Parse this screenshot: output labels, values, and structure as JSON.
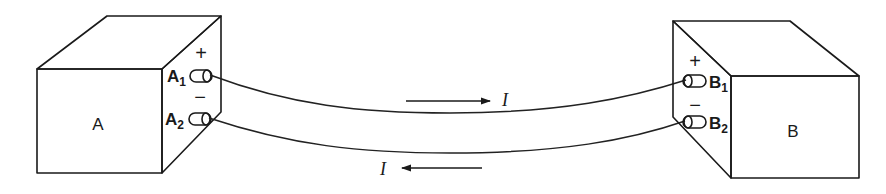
{
  "diagram": {
    "type": "two-box current circuit",
    "colors": {
      "ink": "#1a1a1a",
      "background": "#ffffff",
      "stipple": "#3a3a3a"
    },
    "box_a": {
      "label": "A",
      "terminals": [
        {
          "name": "A",
          "sub": "1",
          "polarity": "+"
        },
        {
          "name": "A",
          "sub": "2",
          "polarity": "−"
        }
      ]
    },
    "box_b": {
      "label": "B",
      "terminals": [
        {
          "name": "B",
          "sub": "1",
          "polarity": "+"
        },
        {
          "name": "B",
          "sub": "2",
          "polarity": "−"
        }
      ]
    },
    "currents": [
      {
        "symbol": "I",
        "direction": "A to B (upper wire)"
      },
      {
        "symbol": "I",
        "direction": "B to A (lower wire)"
      }
    ]
  }
}
